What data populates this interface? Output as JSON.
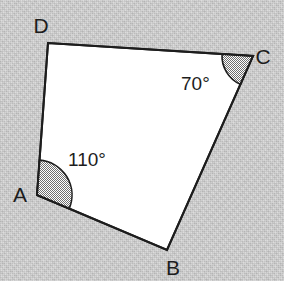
{
  "figure": {
    "name": "quadrilateral-angle-diagram",
    "shape_label": "ABCD",
    "background_color": "#c9c9c9",
    "fill_color": "#ffffff",
    "stroke_color": "#1d1d1d",
    "stroke_width": 2,
    "sector_fill_color": "#9a9a9a",
    "width": 284,
    "height": 281
  },
  "vertices": [
    {
      "id": "A",
      "label": "A",
      "x": 37,
      "y": 195,
      "label_x": 20,
      "label_y": 202
    },
    {
      "id": "B",
      "label": "B",
      "x": 167,
      "y": 250,
      "label_x": 173,
      "label_y": 275
    },
    {
      "id": "C",
      "label": "C",
      "x": 253,
      "y": 56,
      "label_x": 263,
      "label_y": 64
    },
    {
      "id": "D",
      "label": "D",
      "x": 48,
      "y": 43,
      "label_x": 41,
      "label_y": 33
    }
  ],
  "edges": [
    {
      "id": "AB",
      "from": "A",
      "to": "B"
    },
    {
      "id": "BC",
      "from": "B",
      "to": "C"
    },
    {
      "id": "CD",
      "from": "C",
      "to": "D"
    },
    {
      "id": "DA",
      "from": "D",
      "to": "A"
    }
  ],
  "angles": [
    {
      "id": "angle-A",
      "vertex": "A",
      "value": 110,
      "label": "110°",
      "radius": 35,
      "label_x": 68,
      "label_y": 166,
      "shaded": true
    },
    {
      "id": "angle-C",
      "vertex": "C",
      "value": 70,
      "label": "70°",
      "radius": 31,
      "label_x": 181,
      "label_y": 90,
      "shaded": true
    }
  ]
}
